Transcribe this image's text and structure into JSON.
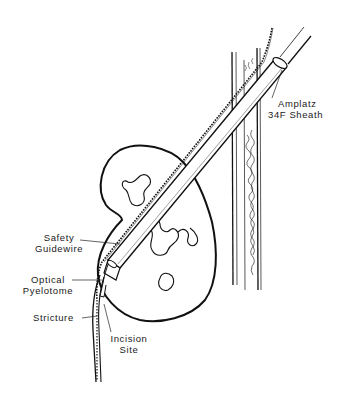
{
  "figure": {
    "type": "medical-illustration",
    "line_color": "#111111",
    "background": "#ffffff"
  },
  "labels": {
    "sheath": {
      "line1": "Amplatz",
      "line2": "34F Sheath"
    },
    "guidewire": {
      "line1": "Safety",
      "line2": "Guidewire"
    },
    "pyelotome": {
      "line1": "Optical",
      "line2": "Pyelotome"
    },
    "stricture": {
      "line1": "Stricture"
    },
    "incision": {
      "line1": "Incision",
      "line2": "Site"
    }
  }
}
